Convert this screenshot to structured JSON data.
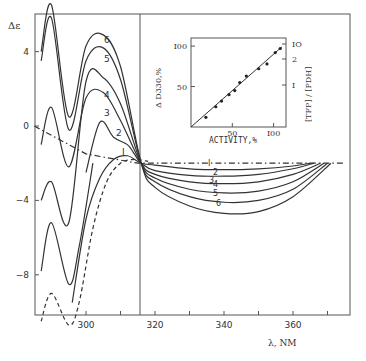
{
  "chart_data": [
    {
      "type": "line",
      "title": "",
      "xlabel": "λ, NM",
      "ylabel": "Δε",
      "xlim": [
        285,
        380
      ],
      "ylim": [
        -11,
        6
      ],
      "x_ticks": [
        300,
        310,
        320,
        330,
        340,
        350,
        360,
        370
      ],
      "x_tick_labels": [
        "300",
        "320",
        "340",
        "360"
      ],
      "y_ticks": [
        4,
        0,
        -4,
        -8
      ],
      "y_tick_labels": [
        "4",
        "0",
        "-4",
        "-8"
      ],
      "grid": false,
      "divider_x": 315.5,
      "series": [
        {
          "name": "1",
          "style": "solid",
          "label": "I",
          "x": [
            296,
            300,
            304,
            308,
            312,
            316,
            320,
            330,
            340,
            350,
            360,
            365
          ],
          "y": [
            -9.5,
            -5.0,
            -2.8,
            -1.8,
            -1.6,
            -2.0,
            -2.1,
            -2.3,
            -2.35,
            -2.3,
            -2.15,
            -2.0
          ]
        },
        {
          "name": "2",
          "style": "solid",
          "x": [
            300,
            304,
            308,
            312,
            314,
            316,
            320,
            330,
            340,
            350,
            360,
            366
          ],
          "y": [
            -2.5,
            0.2,
            -0.6,
            -1.0,
            -1.5,
            -2.0,
            -2.4,
            -2.65,
            -2.7,
            -2.6,
            -2.3,
            -2.0
          ]
        },
        {
          "name": "3",
          "style": "solid",
          "x": [
            287,
            290,
            295,
            300,
            305,
            310,
            316,
            320,
            330,
            340,
            350,
            360,
            368
          ],
          "y": [
            -1.0,
            1.0,
            -2.2,
            1.5,
            1.8,
            0.3,
            -2.0,
            -2.6,
            -3.0,
            -3.1,
            -3.0,
            -2.6,
            -2.0
          ]
        },
        {
          "name": "4",
          "style": "solid",
          "x": [
            287,
            290,
            295,
            300,
            305,
            310,
            316,
            320,
            330,
            340,
            350,
            360,
            369
          ],
          "y": [
            -4.0,
            -3.0,
            -5.2,
            2.4,
            2.6,
            1.2,
            -2.0,
            -2.8,
            -3.4,
            -3.6,
            -3.5,
            -3.0,
            -2.0
          ]
        },
        {
          "name": "5",
          "style": "solid",
          "x": [
            287,
            290,
            295,
            300,
            305,
            310,
            316,
            320,
            330,
            340,
            350,
            360,
            370
          ],
          "y": [
            3.5,
            5.8,
            -0.2,
            3.5,
            4.2,
            2.5,
            -2.0,
            -3.0,
            -3.8,
            -4.1,
            -4.0,
            -3.4,
            -2.0
          ]
        },
        {
          "name": "6",
          "style": "solid",
          "x": [
            287,
            290,
            295,
            300,
            305,
            310,
            316,
            320,
            330,
            340,
            350,
            360,
            371
          ],
          "y": [
            4.0,
            6.5,
            0.5,
            4.3,
            4.9,
            3.2,
            -2.0,
            -3.3,
            -4.3,
            -4.7,
            -4.6,
            -3.8,
            -2.0
          ]
        },
        {
          "name": "lower",
          "style": "solid",
          "x": [
            287,
            290,
            295,
            298,
            302
          ],
          "y": [
            -7.8,
            -5.2,
            -8.5,
            -6.5,
            -2.0
          ]
        },
        {
          "name": "dashed",
          "style": "dashed",
          "x": [
            287,
            290,
            295,
            298,
            302,
            306,
            310,
            314,
            318
          ],
          "y": [
            -10.5,
            -9.0,
            -10.7,
            -9.5,
            -5.5,
            -3.0,
            -2.0,
            -1.8,
            -1.9
          ]
        },
        {
          "name": "baseline",
          "style": "dash-dot",
          "x": [
            285,
            300,
            315,
            375
          ],
          "y": [
            0.0,
            -1.5,
            -2.0,
            -2.0
          ]
        }
      ],
      "curve_labels": [
        "6",
        "5",
        "4",
        "3",
        "2",
        "I"
      ],
      "right_curve_labels": [
        "I",
        "2",
        "3",
        "4",
        "5",
        "6"
      ]
    },
    {
      "type": "scatter",
      "title": "",
      "xlabel": "ACTIVITY,%",
      "ylabel": "Δ D330,%",
      "ylabel_right": "[TFP] / [PDH]",
      "xlim": [
        0,
        115
      ],
      "ylim": [
        0,
        110
      ],
      "x_tick_labels": [
        "50",
        "I00"
      ],
      "y_tick_labels": [
        "50",
        "I00"
      ],
      "y_right_tick_labels": [
        "I",
        "2",
        "IO"
      ],
      "points": [
        {
          "x": 18,
          "y": 12
        },
        {
          "x": 30,
          "y": 25
        },
        {
          "x": 37,
          "y": 32
        },
        {
          "x": 46,
          "y": 40
        },
        {
          "x": 53,
          "y": 45
        },
        {
          "x": 59,
          "y": 55
        },
        {
          "x": 67,
          "y": 63
        },
        {
          "x": 82,
          "y": 72
        },
        {
          "x": 92,
          "y": 78
        },
        {
          "x": 102,
          "y": 92
        },
        {
          "x": 108,
          "y": 97
        }
      ],
      "fit_line": {
        "x": [
          0,
          110
        ],
        "y": [
          0,
          99
        ]
      }
    }
  ],
  "labels": {
    "y_axis_symbol": "Δε",
    "x_axis_label": "λ, NM",
    "inset_xlabel": "ACTIVITY,%",
    "inset_ylabel": "Δ D330,%",
    "inset_ylabel_right": "[TFP] / [PDH]"
  }
}
